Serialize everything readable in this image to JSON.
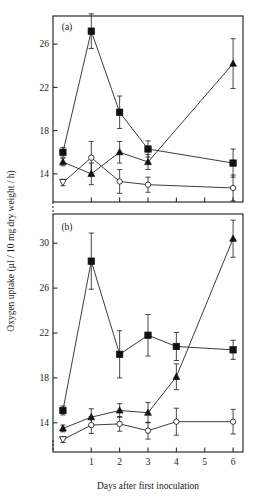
{
  "figure": {
    "xlabel": "Days after first inoculation",
    "ylabel": "Oxygen uptake (µl / 10 mg dry weight / h)",
    "panel_a_label": "(a)",
    "panel_b_label": "(b)"
  },
  "axes": {
    "x_ticks": [
      "1",
      "2",
      "3",
      "4",
      "5",
      "6"
    ],
    "y_ticks_a": [
      "14",
      "18",
      "22",
      "26"
    ],
    "y_ticks_b": [
      "14",
      "18",
      "22",
      "26",
      "30"
    ]
  },
  "chart_data": [
    {
      "type": "line",
      "panel": "(a)",
      "title": "(a)",
      "xlabel": "Days after first inoculation",
      "ylabel": "Oxygen uptake (µl / 10 mg dry weight / h)",
      "x": [
        0,
        1,
        2,
        3,
        4,
        6
      ],
      "xlim": [
        -0.35,
        6.35
      ],
      "ylim": [
        11.4,
        28.6
      ],
      "xticks": [
        1,
        2,
        3,
        4,
        5,
        6
      ],
      "yticks": [
        14,
        18,
        22,
        26
      ],
      "grid": false,
      "legend": "none",
      "series": [
        {
          "name": "filled-square",
          "marker": "filled square",
          "values": [
            16.0,
            27.2,
            19.7,
            16.3,
            15.0
          ],
          "x": [
            0,
            1,
            2,
            3,
            6
          ],
          "errors": [
            0.45,
            1.6,
            1.5,
            0.75,
            1.3
          ]
        },
        {
          "name": "filled-triangle",
          "marker": "filled triangle",
          "values": [
            15.1,
            14.0,
            16.0,
            15.1,
            24.2
          ],
          "x": [
            0,
            1,
            2,
            3,
            6
          ],
          "errors": [
            0.35,
            1.0,
            1.0,
            0.7,
            2.3
          ]
        },
        {
          "name": "open-circle",
          "marker": "open circle (open triangle at day 0)",
          "values": [
            13.2,
            15.5,
            13.3,
            13.0,
            12.7
          ],
          "x": [
            0,
            1,
            2,
            3,
            6
          ],
          "errors": [
            0.3,
            1.5,
            1.1,
            0.7,
            1.2
          ]
        }
      ]
    },
    {
      "type": "line",
      "panel": "(b)",
      "title": "(b)",
      "xlabel": "Days after first inoculation",
      "ylabel": "Oxygen uptake (µl / 10 mg dry weight / h)",
      "x": [
        0,
        1,
        2,
        3,
        4,
        6
      ],
      "xlim": [
        -0.35,
        6.35
      ],
      "ylim": [
        11.4,
        32.6
      ],
      "xticks": [
        1,
        2,
        3,
        4,
        5,
        6
      ],
      "yticks": [
        14,
        18,
        22,
        26,
        30
      ],
      "grid": false,
      "legend": "none",
      "series": [
        {
          "name": "filled-square",
          "marker": "filled square",
          "values": [
            15.1,
            28.4,
            20.1,
            21.8,
            20.8,
            20.5
          ],
          "x": [
            0,
            1,
            2,
            3,
            4,
            6
          ],
          "errors": [
            0.4,
            2.5,
            2.1,
            1.85,
            1.25,
            0.85
          ]
        },
        {
          "name": "filled-triangle",
          "marker": "filled triangle",
          "values": [
            13.5,
            14.5,
            15.1,
            14.9,
            18.1,
            30.4
          ],
          "x": [
            0,
            1,
            2,
            3,
            4,
            6
          ],
          "errors": [
            0.3,
            0.75,
            0.6,
            0.9,
            1.15,
            1.65
          ]
        },
        {
          "name": "open-circle",
          "marker": "open circle (open triangle at day 0)",
          "values": [
            12.5,
            13.8,
            13.9,
            13.3,
            14.1,
            14.1
          ],
          "x": [
            0,
            1,
            2,
            3,
            4,
            6
          ],
          "errors": [
            0.25,
            0.75,
            0.65,
            0.75,
            1.2,
            1.1
          ]
        }
      ]
    }
  ]
}
